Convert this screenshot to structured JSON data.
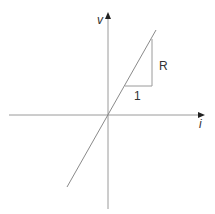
{
  "diagram": {
    "axes": {
      "x_label": "i",
      "y_label": "v"
    },
    "slope_triangle": {
      "run_label": "1",
      "rise_label": "R"
    },
    "colors": {
      "axis": "#9a9a9a",
      "line": "#8a8a8a",
      "triangle": "#9a9a9a",
      "arrowhead": "#222222",
      "text": "#333333"
    }
  }
}
